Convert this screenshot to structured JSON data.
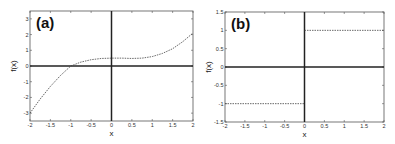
{
  "chart_data": [
    {
      "type": "line",
      "panel_label": "(a)",
      "xlabel": "x",
      "ylabel": "f(x)",
      "xlim": [
        -2,
        2
      ],
      "ylim": [
        -3.5,
        3.5
      ],
      "xticks": [
        -2,
        -1.5,
        -1,
        -0.5,
        0,
        0.5,
        1,
        1.5,
        2
      ],
      "xtick_labels": [
        "-2",
        "-1.5",
        "-1",
        "-0.5",
        "0",
        "0.5",
        "1",
        "1.5",
        "2"
      ],
      "yticks": [
        -3,
        -2,
        -1,
        0,
        1,
        2,
        3
      ],
      "ytick_labels": [
        "-3",
        "-2",
        "-1",
        "0",
        "1",
        "2",
        "3"
      ],
      "grid": false,
      "series": [
        {
          "name": "f(x)",
          "style": "dashed",
          "x": [
            -2,
            -1.75,
            -1.5,
            -1.25,
            -1,
            -0.75,
            -0.5,
            -0.25,
            0,
            0.25,
            0.5,
            0.75,
            1,
            1.25,
            1.5,
            1.75,
            2
          ],
          "y": [
            -3.0,
            -2.1,
            -1.3,
            -0.6,
            0.0,
            0.25,
            0.4,
            0.48,
            0.5,
            0.5,
            0.48,
            0.5,
            0.6,
            0.8,
            1.1,
            1.55,
            2.1
          ]
        }
      ]
    },
    {
      "type": "line",
      "panel_label": "(b)",
      "xlabel": "x",
      "ylabel": "f(x)",
      "xlim": [
        -2,
        2
      ],
      "ylim": [
        -1.5,
        1.5
      ],
      "xticks": [
        -2,
        -1.5,
        -1,
        -0.5,
        0,
        0.5,
        1,
        1.5,
        2
      ],
      "xtick_labels": [
        "-2",
        "-1.5",
        "-1",
        "-0.5",
        "0",
        "0.5",
        "1",
        "1.5",
        "2"
      ],
      "yticks": [
        -1.5,
        -1,
        -0.5,
        0,
        0.5,
        1,
        1.5
      ],
      "ytick_labels": [
        "-1.5",
        "-1",
        "-0.5",
        "0",
        "0.5",
        "1",
        "1.5"
      ],
      "grid": false,
      "series": [
        {
          "name": "f(x) (x<0)",
          "style": "dashed",
          "x": [
            -2,
            0
          ],
          "y": [
            -1,
            -1
          ]
        },
        {
          "name": "f(x) (x>0)",
          "style": "dashed",
          "x": [
            0,
            2
          ],
          "y": [
            1,
            1
          ]
        }
      ]
    }
  ]
}
